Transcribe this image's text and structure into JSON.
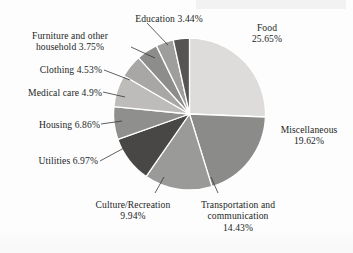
{
  "chart_data": {
    "type": "pie",
    "title": "",
    "subtitle": "",
    "xlabel": "",
    "ylabel": "",
    "legend_position": "none",
    "grid": false,
    "units": "percent",
    "start_angle_deg": 0,
    "direction": "clockwise",
    "categories": [
      "Food",
      "Miscellaneous",
      "Transportation and communication",
      "Culture/Recreation",
      "Utilities",
      "Housing",
      "Medical care",
      "Clothing",
      "Furniture and other household",
      "Education"
    ],
    "values": [
      25.65,
      19.62,
      14.43,
      9.94,
      6.97,
      6.86,
      4.9,
      4.53,
      3.75,
      3.44
    ],
    "value_labels": [
      "25.65%",
      "19.62%",
      "14.43%",
      "9.94%",
      "6.97%",
      "6.86%",
      "4.9%",
      "4.53%",
      "3.75%",
      "3.44%"
    ],
    "colors": [
      "#dddcda",
      "#8b8b89",
      "#9a9a98",
      "#484745",
      "#8f8f8d",
      "#bdbcba",
      "#a8a7a5",
      "#8d8d8b",
      "#9e9e9c",
      "#565553"
    ],
    "slice_border_color": "#ffffff",
    "slices": [
      {
        "name": "Food",
        "value": 25.65,
        "label": "Food",
        "percent_text": "25.65%",
        "color": "#dddcda"
      },
      {
        "name": "Miscellaneous",
        "value": 19.62,
        "label": "Miscellaneous",
        "percent_text": "19.62%",
        "color": "#8b8b89"
      },
      {
        "name": "Transportation and communication",
        "value": 14.43,
        "label": "Transportation and communication",
        "percent_text": "14.43%",
        "color": "#9a9a98"
      },
      {
        "name": "Culture/Recreation",
        "value": 9.94,
        "label": "Culture/Recreation",
        "percent_text": "9.94%",
        "color": "#484745"
      },
      {
        "name": "Utilities",
        "value": 6.97,
        "label": "Utilities",
        "percent_text": "6.97%",
        "color": "#8f8f8d"
      },
      {
        "name": "Housing",
        "value": 6.86,
        "label": "Housing",
        "percent_text": "6.86%",
        "color": "#bdbcba"
      },
      {
        "name": "Medical care",
        "value": 4.9,
        "label": "Medical care",
        "percent_text": "4.9%",
        "color": "#a8a7a5"
      },
      {
        "name": "Clothing",
        "value": 4.53,
        "label": "Clothing",
        "percent_text": "4.53%",
        "color": "#8d8d8b"
      },
      {
        "name": "Furniture and other household",
        "value": 3.75,
        "label": "Furniture and other household",
        "percent_text": "3.75%",
        "color": "#9e9e9c"
      },
      {
        "name": "Education",
        "value": 3.44,
        "label": "Education",
        "percent_text": "3.44%",
        "color": "#565553"
      }
    ]
  },
  "labels": {
    "food_l1": "Food",
    "food_l2": "25.65%",
    "miscellaneous_l1": "Miscellaneous",
    "miscellaneous_l2": "19.62%",
    "transportation_l1": "Transportation and",
    "transportation_l2": "communication",
    "transportation_l3": "14.43%",
    "culture_l1": "Culture/Recreation",
    "culture_l2": "9.94%",
    "utilities": "Utilities 6.97%",
    "housing": "Housing 6.86%",
    "medical": "Medical care 4.9%",
    "clothing": "Clothing 4.53%",
    "furniture_l1": "Furniture and other",
    "furniture_l2": "household 3.75%",
    "education": "Education 3.44%"
  }
}
